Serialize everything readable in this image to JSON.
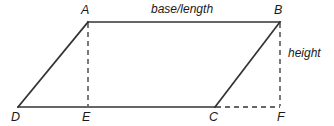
{
  "figure": {
    "shape": "parallelogram",
    "stroke_color": "#333333",
    "dash_color": "#333333",
    "background_color": "#ffffff",
    "solid_stroke_width": 1.6,
    "dashed_stroke_width": 1.3,
    "dash_pattern": "5,4"
  },
  "vertices": {
    "A": {
      "label": "A",
      "x": 88,
      "y": 22
    },
    "B": {
      "label": "B",
      "x": 280,
      "y": 22
    },
    "C": {
      "label": "C",
      "x": 215,
      "y": 107
    },
    "D": {
      "label": "D",
      "x": 18,
      "y": 107
    },
    "E": {
      "label": "E",
      "x": 88,
      "y": 107
    },
    "F": {
      "label": "F",
      "x": 280,
      "y": 107
    }
  },
  "edges": {
    "solid": [
      {
        "name": "top-side-AB",
        "from": "A",
        "to": "B"
      },
      {
        "name": "left-side-DA",
        "from": "D",
        "to": "A"
      },
      {
        "name": "right-side-CB",
        "from": "C",
        "to": "B"
      },
      {
        "name": "bottom-side-DC",
        "from": "D",
        "to": "C"
      }
    ],
    "dashed": [
      {
        "name": "height-segment-AE",
        "from": "A",
        "to": "E"
      },
      {
        "name": "height-segment-BF",
        "from": "B",
        "to": "F"
      },
      {
        "name": "base-extension-CF",
        "from": "C",
        "to": "F"
      }
    ]
  },
  "annotations": {
    "base_label": "base/length",
    "height_label": "height"
  }
}
